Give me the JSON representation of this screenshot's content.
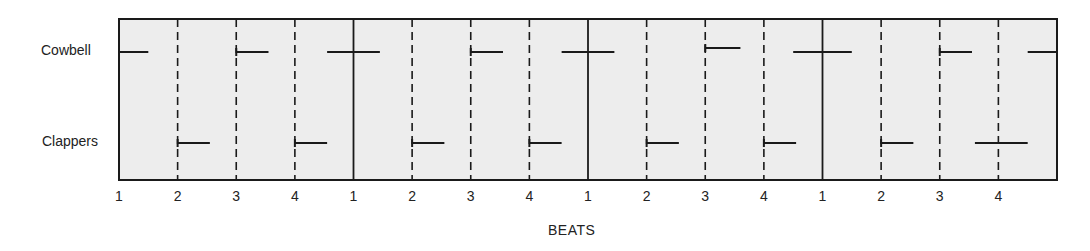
{
  "chart_data": {
    "type": "timing-diagram",
    "title": "",
    "xlabel": "BEATS",
    "ylabel": "",
    "rows": [
      "Cowbell",
      "Clappers"
    ],
    "beat_labels": [
      "1",
      "2",
      "3",
      "4",
      "1",
      "2",
      "3",
      "4",
      "1",
      "2",
      "3",
      "4",
      "1",
      "2",
      "3",
      "4"
    ],
    "measures": 4,
    "beats_per_measure": 4,
    "grid": {
      "measure_lines": "solid",
      "beat_lines": "dashed"
    },
    "background_color": "#ededed",
    "line_color": "#1a1a1a",
    "events": {
      "Cowbell": [
        {
          "start": 0.0,
          "end": 0.5
        },
        {
          "start": 2.0,
          "end": 2.55
        },
        {
          "start": 3.55,
          "end": 4.45
        },
        {
          "start": 6.0,
          "end": 6.55
        },
        {
          "start": 7.55,
          "end": 8.45
        },
        {
          "start": 10.0,
          "end": 10.6
        },
        {
          "start": 11.5,
          "end": 12.5
        },
        {
          "start": 14.0,
          "end": 14.55
        },
        {
          "start": 15.5,
          "end": 16.0
        }
      ],
      "Clappers": [
        {
          "start": 1.0,
          "end": 1.55
        },
        {
          "start": 3.0,
          "end": 3.55
        },
        {
          "start": 5.0,
          "end": 5.55
        },
        {
          "start": 7.0,
          "end": 7.55
        },
        {
          "start": 9.0,
          "end": 9.55
        },
        {
          "start": 11.0,
          "end": 11.55
        },
        {
          "start": 13.0,
          "end": 13.55
        },
        {
          "start": 14.6,
          "end": 15.5
        }
      ]
    }
  },
  "labels": {
    "row_cowbell": "Cowbell",
    "row_clappers": "Clappers",
    "x_axis_title": "BEATS"
  }
}
